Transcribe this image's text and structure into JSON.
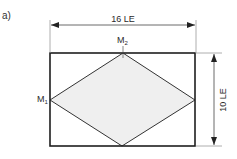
{
  "figure": {
    "label": "a)"
  },
  "dimensions": {
    "width_label": "16 LE",
    "height_label": "10 LE"
  },
  "points": {
    "m1": {
      "base": "M",
      "sub": "1"
    },
    "m2": {
      "base": "M",
      "sub": "2"
    }
  },
  "colors": {
    "stroke": "#222222",
    "dim_line": "#444444",
    "extension_line": "#888888",
    "rhombus_fill": "#efefef",
    "background": "#ffffff"
  }
}
